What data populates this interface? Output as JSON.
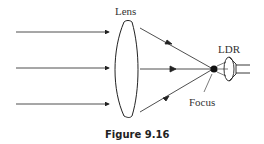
{
  "labels": {
    "lens": "Lens",
    "ldr": "LDR",
    "focus": "Focus"
  },
  "caption": "Figure 9.16",
  "colors": {
    "line": "#222222",
    "text": "#333333"
  }
}
